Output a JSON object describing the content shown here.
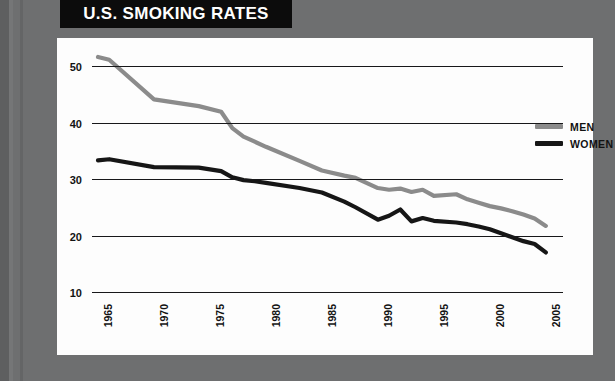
{
  "title": "U.S. SMOKING RATES",
  "axis": {
    "y_label": "PERCENT OF AMERICANS WHO ARE SMOKERS"
  },
  "legend": {
    "items": [
      {
        "label": "MEN",
        "color": "#8b8b8b"
      },
      {
        "label": "WOMEN",
        "color": "#161616"
      }
    ]
  },
  "colors": {
    "background": "#6e6f70",
    "panel": "#fdfdfd",
    "banner": "#0c0c0c",
    "banner_text": "#ffffff",
    "grid": "#18181a",
    "men": "#8b8b8b",
    "women": "#161616"
  },
  "chart_data": {
    "type": "line",
    "title": "U.S. SMOKING RATES",
    "xlabel": "",
    "ylabel": "PERCENT OF AMERICANS WHO ARE SMOKERS",
    "xlim": [
      1965,
      2006
    ],
    "ylim": [
      10,
      50
    ],
    "ytick_labels": [
      "50",
      "40",
      "30",
      "20",
      "10"
    ],
    "yticks": [
      50,
      40,
      30,
      20,
      10
    ],
    "xtick_labels": [
      "1965",
      "1970",
      "1975",
      "1980",
      "1985",
      "1990",
      "1995",
      "2000",
      "2005"
    ],
    "xticks": [
      1965,
      1970,
      1975,
      1980,
      1985,
      1990,
      1995,
      2000,
      2005
    ],
    "grid": true,
    "legend_position": "top-right",
    "series": [
      {
        "name": "MEN",
        "color": "#8b8b8b",
        "x": [
          1965,
          1966,
          1970,
          1974,
          1976,
          1977,
          1978,
          1979,
          1980,
          1983,
          1985,
          1987,
          1988,
          1990,
          1991,
          1992,
          1993,
          1994,
          1995,
          1997,
          1998,
          1999,
          2000,
          2001,
          2002,
          2003,
          2004,
          2005
        ],
        "values": [
          51.6,
          51.1,
          44.1,
          42.9,
          41.9,
          39.0,
          37.5,
          36.6,
          35.7,
          33.2,
          31.5,
          30.6,
          30.2,
          28.4,
          28.1,
          28.3,
          27.7,
          28.1,
          27.0,
          27.3,
          26.4,
          25.8,
          25.2,
          24.8,
          24.3,
          23.7,
          23.0,
          21.7
        ]
      },
      {
        "name": "WOMEN",
        "color": "#161616",
        "x": [
          1965,
          1966,
          1970,
          1974,
          1976,
          1977,
          1978,
          1979,
          1980,
          1983,
          1985,
          1987,
          1988,
          1990,
          1991,
          1992,
          1993,
          1994,
          1995,
          1997,
          1998,
          1999,
          2000,
          2001,
          2002,
          2003,
          2004,
          2005
        ],
        "values": [
          33.3,
          33.5,
          32.1,
          32.0,
          31.4,
          30.3,
          29.8,
          29.6,
          29.3,
          28.4,
          27.6,
          26.0,
          25.0,
          22.8,
          23.5,
          24.6,
          22.5,
          23.1,
          22.6,
          22.3,
          22.0,
          21.6,
          21.1,
          20.4,
          19.7,
          19.0,
          18.5,
          17.0
        ]
      }
    ]
  }
}
